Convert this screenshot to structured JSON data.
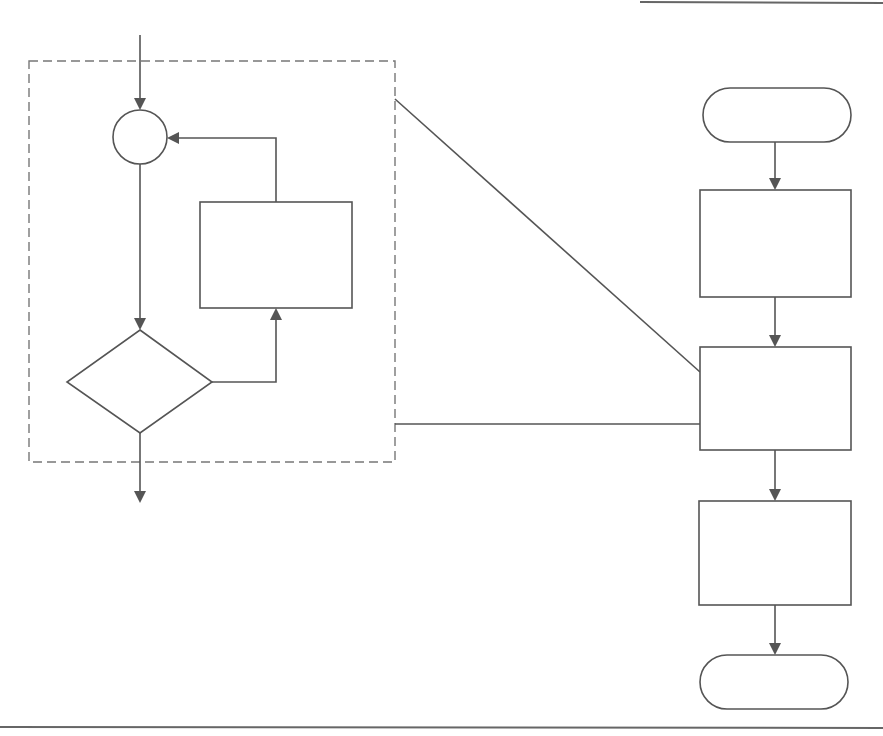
{
  "diagram": {
    "type": "flowchart",
    "colors": {
      "stroke": "#555555",
      "dashed_border": "#777777",
      "background": "#ffffff"
    },
    "loop_detail": {
      "entry_arrow": "",
      "junction_label": "",
      "loop_process_label": "",
      "decision_label": "",
      "exit_arrow": ""
    },
    "main_flow": {
      "start_label": "",
      "step1_label": "",
      "step2_label": "",
      "step3_label": "",
      "end_label": ""
    },
    "nodes": [
      {
        "id": "junction",
        "shape": "circle"
      },
      {
        "id": "loop-process",
        "shape": "rectangle"
      },
      {
        "id": "decision",
        "shape": "diamond"
      },
      {
        "id": "start",
        "shape": "terminator"
      },
      {
        "id": "step1",
        "shape": "rectangle"
      },
      {
        "id": "step2",
        "shape": "rectangle"
      },
      {
        "id": "step3",
        "shape": "rectangle"
      },
      {
        "id": "end",
        "shape": "terminator"
      }
    ],
    "edges": [
      {
        "from": "entry",
        "to": "junction",
        "arrow": true
      },
      {
        "from": "junction",
        "to": "decision",
        "arrow": true
      },
      {
        "from": "decision",
        "to": "loop-process",
        "arrow": true
      },
      {
        "from": "loop-process",
        "to": "junction",
        "arrow": true
      },
      {
        "from": "decision",
        "to": "exit",
        "arrow": true
      },
      {
        "from": "start",
        "to": "step1",
        "arrow": true
      },
      {
        "from": "step1",
        "to": "step2",
        "arrow": true
      },
      {
        "from": "step2",
        "to": "step3",
        "arrow": true
      },
      {
        "from": "step3",
        "to": "end",
        "arrow": true
      },
      {
        "from": "loop-detail-box",
        "to": "step2",
        "arrow": false,
        "kind": "expansion-callout"
      }
    ]
  }
}
